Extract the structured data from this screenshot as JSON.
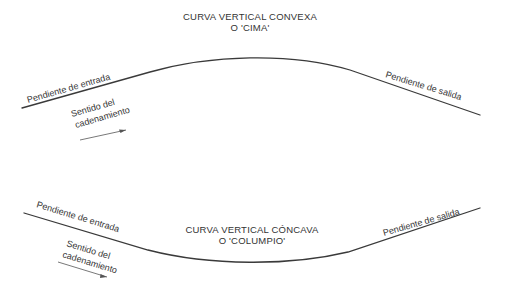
{
  "convex": {
    "title_line1": "CURVA VERTICAL CONVEXA",
    "title_line2": "O 'CIMA'",
    "entry_label": "Pendiente de entrada",
    "exit_label": "Pendiente de salida",
    "direction_line1": "Sentido del",
    "direction_line2": "cadenamiento"
  },
  "concave": {
    "title_line1": "CURVA VERTICAL CÓNCAVA",
    "title_line2": "O 'COLUMPIO'",
    "entry_label": "Pendiente de entrada",
    "exit_label": "Pendiente de salida",
    "direction_line1": "Sentido del",
    "direction_line2": "cadenamiento"
  },
  "colors": {
    "line": "#3a3a3a",
    "text": "#333333",
    "background": "#ffffff"
  }
}
